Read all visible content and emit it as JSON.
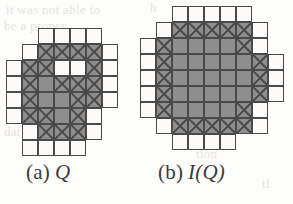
{
  "figure": {
    "type": "pixel-grid-diagram",
    "cell_size_px": 16,
    "colors": {
      "background": "#fdfdfc",
      "grid_line": "#4a4a4a",
      "fill_gray": "#8e8e8e",
      "empty_white": "#fcfbf9",
      "caption_text": "#3a3a3a",
      "scan_ghost": "#e7e4de"
    },
    "legend": {
      "empty": "empty cell",
      "cross": "boundary cell",
      "filled": "interior cell"
    },
    "panels": [
      {
        "id": "panel-a",
        "caption_prefix": "(a)",
        "caption_symbol": "Q",
        "cols": 8,
        "rows": 8,
        "cells": [
          [
            null,
            null,
            "empty",
            "empty",
            "empty",
            "empty",
            null,
            null
          ],
          [
            null,
            "empty",
            "cross",
            "cross",
            "cross",
            "cross",
            "empty",
            null
          ],
          [
            "empty",
            "cross",
            "cross",
            "empty",
            "empty",
            "cross",
            "empty",
            null
          ],
          [
            "empty",
            "cross",
            "filled",
            "cross",
            "cross",
            "cross",
            "empty",
            null
          ],
          [
            "empty",
            "cross",
            "filled",
            "filled",
            "cross",
            "cross",
            "empty",
            null
          ],
          [
            "empty",
            "cross",
            "cross",
            "filled",
            "cross",
            "empty",
            null,
            null
          ],
          [
            null,
            "empty",
            "cross",
            "cross",
            "cross",
            "empty",
            null,
            null
          ],
          [
            null,
            "empty",
            "empty",
            "empty",
            "empty",
            null,
            null,
            null
          ]
        ]
      },
      {
        "id": "panel-b",
        "caption_prefix": "(b)",
        "caption_symbol": "I(Q)",
        "cols": 9,
        "rows": 9,
        "cells": [
          [
            null,
            null,
            "empty",
            "empty",
            "empty",
            "empty",
            "empty",
            null,
            null
          ],
          [
            null,
            "empty",
            "cross",
            "cross",
            "cross",
            "cross",
            "cross",
            "empty",
            null
          ],
          [
            "empty",
            "cross",
            "filled",
            "filled",
            "filled",
            "filled",
            "cross",
            "empty",
            null
          ],
          [
            "empty",
            "cross",
            "filled",
            "filled",
            "filled",
            "filled",
            "filled",
            "cross",
            "empty"
          ],
          [
            "empty",
            "cross",
            "filled",
            "filled",
            "filled",
            "filled",
            "filled",
            "cross",
            "empty"
          ],
          [
            "empty",
            "cross",
            "filled",
            "filled",
            "filled",
            "filled",
            "filled",
            "cross",
            "empty"
          ],
          [
            "empty",
            "cross",
            "filled",
            "filled",
            "filled",
            "filled",
            "cross",
            "empty",
            null
          ],
          [
            null,
            "empty",
            "cross",
            "cross",
            "cross",
            "cross",
            "cross",
            "empty",
            null
          ],
          [
            null,
            null,
            "empty",
            "empty",
            "empty",
            "empty",
            null,
            null,
            null
          ]
        ]
      }
    ]
  },
  "scan_artifacts": {
    "ghost_lines": [
      "it was not able to",
      "be a proper",
      "0 0 0 0",
      "and",
      "dat",
      "tion",
      "tl",
      "h"
    ]
  }
}
